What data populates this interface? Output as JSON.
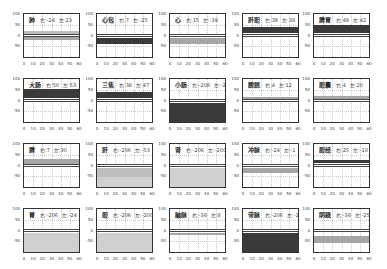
{
  "chart_data": [
    {
      "type": "area",
      "title": "肺",
      "right_label": "右:",
      "right": -24,
      "left_label": "左:",
      "left": 23,
      "band": [
        -20,
        -5
      ],
      "band_dark": false,
      "band2": [
        5,
        20
      ],
      "x": [
        0,
        10,
        20,
        30,
        40,
        50,
        60
      ],
      "yticks": [
        100,
        50,
        0,
        -50
      ],
      "ylim": [
        -100,
        100
      ],
      "xlim": [
        0,
        60
      ]
    },
    {
      "type": "area",
      "title": "心包",
      "right_label": "右:",
      "right": 7,
      "left_label": "左:",
      "left": -25,
      "band": [
        -40,
        -10
      ],
      "band_dark": true,
      "x": [
        0,
        10,
        20,
        30,
        40,
        50,
        60
      ],
      "yticks": [
        100,
        50,
        0,
        -50
      ],
      "ylim": [
        -100,
        100
      ],
      "xlim": [
        0,
        60
      ]
    },
    {
      "type": "area",
      "title": "心",
      "right_label": "右:",
      "right": 15,
      "left_label": "左:",
      "left": -39,
      "band": [
        -40,
        -10
      ],
      "band_dark": false,
      "x": [
        0,
        10,
        20,
        30,
        40,
        50,
        60
      ],
      "yticks": [
        100,
        50,
        0,
        -50
      ],
      "ylim": [
        -100,
        100
      ],
      "xlim": [
        0,
        60
      ]
    },
    {
      "type": "area",
      "title": "肝胆",
      "right_label": "右:",
      "right": 38,
      "left_label": "左:",
      "left": 38,
      "band": [
        10,
        40
      ],
      "band_dark": true,
      "x": [
        0,
        10,
        20,
        30,
        40,
        50,
        60
      ],
      "yticks": [
        100,
        50,
        0,
        -50
      ],
      "ylim": [
        -100,
        100
      ],
      "xlim": [
        0,
        60
      ]
    },
    {
      "type": "area",
      "title": "脾胃",
      "right_label": "右:",
      "right": 49,
      "left_label": "左:",
      "left": 42,
      "band": [
        10,
        48
      ],
      "band_dark": true,
      "x": [
        0,
        10,
        20,
        30,
        40,
        50,
        60
      ],
      "yticks": [
        100,
        50,
        0,
        -50
      ],
      "ylim": [
        -100,
        100
      ],
      "xlim": [
        0,
        60
      ]
    },
    {
      "type": "area",
      "title": "大肠",
      "right_label": "右:",
      "right": 50,
      "left_label": "左:",
      "left": 53,
      "band": [
        10,
        52
      ],
      "band_dark": true,
      "x": [
        0,
        10,
        20,
        30,
        40,
        50,
        60
      ],
      "yticks": [
        100,
        50,
        0,
        -50
      ],
      "ylim": [
        -100,
        100
      ],
      "xlim": [
        0,
        60
      ]
    },
    {
      "type": "area",
      "title": "三焦",
      "right_label": "右:",
      "right": 38,
      "left_label": "左:",
      "left": 47,
      "band": [
        10,
        40
      ],
      "band_dark": true,
      "x": [
        0,
        10,
        20,
        30,
        40,
        50,
        60
      ],
      "yticks": [
        100,
        50,
        0,
        -50
      ],
      "ylim": [
        -100,
        100
      ],
      "xlim": [
        0,
        60
      ]
    },
    {
      "type": "area",
      "title": "小肠",
      "right_label": "右:",
      "right": -208,
      "left_label": "左:",
      "left": -208,
      "band": [
        -100,
        -10
      ],
      "band_dark": true,
      "x": [
        0,
        10,
        20,
        30,
        40,
        50,
        60
      ],
      "yticks": [
        100,
        50,
        0,
        -50
      ],
      "ylim": [
        -100,
        100
      ],
      "xlim": [
        0,
        60
      ]
    },
    {
      "type": "area",
      "title": "膀胱",
      "right_label": "右:",
      "right": 4,
      "left_label": "左:",
      "left": 12,
      "band": [
        5,
        15
      ],
      "band_dark": false,
      "x": [
        0,
        10,
        20,
        30,
        40,
        50,
        60
      ],
      "yticks": [
        100,
        50,
        0,
        -50
      ],
      "ylim": [
        -100,
        100
      ],
      "xlim": [
        0,
        60
      ]
    },
    {
      "type": "area",
      "title": "胆囊",
      "right_label": "右:",
      "right": 4,
      "left_label": "左:",
      "left": 20,
      "band": [
        5,
        20
      ],
      "band_dark": false,
      "x": [
        0,
        10,
        20,
        30,
        40,
        50,
        60
      ],
      "yticks": [
        100,
        50,
        0,
        -50
      ],
      "ylim": [
        -100,
        100
      ],
      "xlim": [
        0,
        60
      ]
    },
    {
      "type": "area",
      "title": "脾",
      "right_label": "右:",
      "right": 7,
      "left_label": "左:",
      "left": 30,
      "band": [
        5,
        30
      ],
      "band_dark": false,
      "x": [
        0,
        10,
        20,
        30,
        40,
        50,
        60
      ],
      "yticks": [
        100,
        50,
        0,
        -50
      ],
      "ylim": [
        -100,
        100
      ],
      "xlim": [
        0,
        60
      ]
    },
    {
      "type": "area",
      "title": "肝",
      "right_label": "右:",
      "right": -206,
      "left_label": "左:",
      "left": -53,
      "band": [
        -100,
        -55
      ],
      "band_dark": false,
      "band2": [
        -55,
        -10
      ],
      "x": [
        0,
        10,
        20,
        30,
        40,
        50,
        60
      ],
      "yticks": [
        100,
        50,
        0,
        -50
      ],
      "ylim": [
        -100,
        100
      ],
      "xlim": [
        0,
        60
      ]
    },
    {
      "type": "area",
      "title": "肾",
      "right_label": "右:",
      "right": -206,
      "left_label": "左:",
      "left": -200,
      "band": [
        -100,
        -10
      ],
      "band_dark": false,
      "x": [
        0,
        10,
        20,
        30,
        40,
        50,
        60
      ],
      "yticks": [
        100,
        50,
        0,
        -50
      ],
      "ylim": [
        -100,
        100
      ],
      "xlim": [
        0,
        60
      ]
    },
    {
      "type": "area",
      "title": "冲脉",
      "right_label": "右:",
      "right": -24,
      "left_label": "左:",
      "left": -1,
      "band": [
        -35,
        -10
      ],
      "band_dark": false,
      "x": [
        0,
        10,
        20,
        30,
        40,
        50,
        60
      ],
      "yticks": [
        100,
        50,
        0,
        -50
      ],
      "ylim": [
        -100,
        100
      ],
      "xlim": [
        0,
        60
      ]
    },
    {
      "type": "area",
      "title": "胆经",
      "right_label": "右:",
      "right": 25,
      "left_label": "左:",
      "left": -10,
      "band": [
        10,
        25
      ],
      "band_dark": true,
      "x": [
        0,
        10,
        20,
        30,
        40,
        50,
        60
      ],
      "yticks": [
        100,
        50,
        0,
        -50
      ],
      "ylim": [
        -100,
        100
      ],
      "xlim": [
        0,
        60
      ]
    },
    {
      "type": "area",
      "title": "胃",
      "right_label": "右:",
      "right": -206,
      "left_label": "左:",
      "left": -24,
      "band": [
        -100,
        -10
      ],
      "band_dark": false,
      "x": [
        0,
        10,
        20,
        30,
        40,
        50,
        60
      ],
      "yticks": [
        100,
        50,
        0,
        -50
      ],
      "ylim": [
        -100,
        100
      ],
      "xlim": [
        0,
        60
      ]
    },
    {
      "type": "area",
      "title": "胆",
      "right_label": "右:",
      "right": -206,
      "left_label": "左:",
      "left": -200,
      "band": [
        -100,
        -10
      ],
      "band_dark": false,
      "x": [
        0,
        10,
        20,
        30,
        40,
        50,
        60
      ],
      "yticks": [
        100,
        50,
        0,
        -50
      ],
      "ylim": [
        -100,
        100
      ],
      "xlim": [
        0,
        60
      ]
    },
    {
      "type": "area",
      "title": "脑脉",
      "right_label": "右:",
      "right": -38,
      "left_label": "左:",
      "left": 8,
      "band": [
        -20,
        -10
      ],
      "band_dark": false,
      "x": [
        0,
        10,
        20,
        30,
        40,
        50,
        60
      ],
      "yticks": [
        100,
        50,
        0,
        -50
      ],
      "ylim": [
        -100,
        100
      ],
      "xlim": [
        0,
        60
      ]
    },
    {
      "type": "area",
      "title": "带脉",
      "right_label": "右:",
      "right": -206,
      "left_label": "左:",
      "left": -10,
      "band": [
        -100,
        -10
      ],
      "band_dark": true,
      "x": [
        0,
        10,
        20,
        30,
        40,
        50,
        60
      ],
      "yticks": [
        100,
        50,
        0,
        -50
      ],
      "ylim": [
        -100,
        100
      ],
      "xlim": [
        0,
        60
      ]
    },
    {
      "type": "area",
      "title": "阴跷",
      "right_label": "右:",
      "right": -38,
      "left_label": "左:",
      "left": -25,
      "band": [
        -60,
        -25
      ],
      "band_dark": false,
      "x": [
        0,
        10,
        20,
        30,
        40,
        50,
        60
      ],
      "yticks": [
        100,
        50,
        0,
        -50
      ],
      "ylim": [
        -100,
        100
      ],
      "xlim": [
        0,
        60
      ]
    }
  ],
  "colors": {
    "band_dark": "#2a2a2a",
    "band_mid": "#8c8c8c",
    "band_light": "#b8b8b8",
    "band_pale": "#d9d9d9",
    "axis": "#333333",
    "grid": "#c8c8c8"
  }
}
